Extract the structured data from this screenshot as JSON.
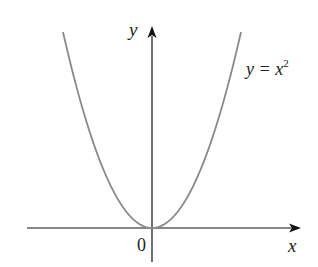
{
  "chart_data": {
    "type": "line",
    "title": "",
    "xlabel": "x",
    "ylabel": "y",
    "origin_label": "0",
    "series": [
      {
        "name": "y = x^2",
        "label_text": "y = x",
        "label_exponent": "2",
        "function": "x^2",
        "x": [
          -2.4,
          -2,
          -1.5,
          -1,
          -0.5,
          0,
          0.5,
          1,
          1.5,
          2,
          2.4
        ],
        "values": [
          5.76,
          4,
          2.25,
          1,
          0.25,
          0,
          0.25,
          1,
          2.25,
          4,
          5.76
        ],
        "color": "#8a8a8a"
      }
    ],
    "axes": {
      "color": "#111111",
      "arrows": true,
      "ticks": false
    },
    "grid": false,
    "legend": "inline annotation near upper-right of curve"
  },
  "labels": {
    "y_axis": "y",
    "x_axis": "x",
    "origin": "0",
    "equation_base": "y = x",
    "equation_exponent": "2"
  }
}
